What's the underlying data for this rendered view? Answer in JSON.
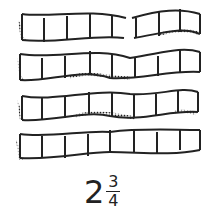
{
  "diagram": {
    "strips": [
      {
        "index": 1,
        "sections": 8,
        "broken": true
      },
      {
        "index": 2,
        "sections": 8,
        "broken": false
      },
      {
        "index": 3,
        "sections": 8,
        "broken": false
      },
      {
        "index": 4,
        "sections": 8,
        "broken": false
      }
    ],
    "label": {
      "whole": "2",
      "numerator": "3",
      "denominator": "4"
    },
    "colors": {
      "ink": "#222222",
      "background": "#ffffff"
    }
  }
}
